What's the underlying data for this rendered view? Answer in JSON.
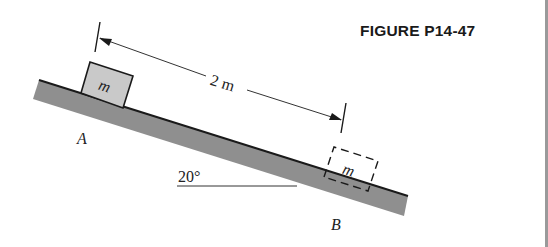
{
  "figure": {
    "title": "FIGURE P14-47",
    "incline_angle_label": "20°",
    "distance_label": "2 m",
    "point_a_label": "A",
    "point_b_label": "B",
    "block_initial_label": "m",
    "block_final_label": "m"
  },
  "colors": {
    "incline_fill": "#8f8f8f",
    "block_fill": "#c9c9c9",
    "line": "#1a1a1a"
  }
}
